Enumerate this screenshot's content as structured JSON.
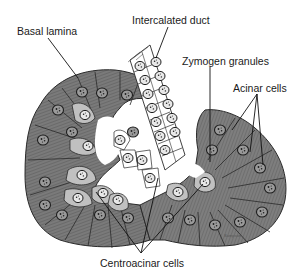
{
  "figure": {
    "labels": {
      "basal_lamina": "Basal lamina",
      "intercalated_duct": "Intercalated duct",
      "zymogen_granules": "Zymogen granules",
      "acinar_cells": "Acinar cells",
      "centroacinar_cells": "Centroacinar cells"
    },
    "signature": "Sampson",
    "colors": {
      "acinar_cell": "#7d7d7d",
      "acinar_dark": "#5e5e5e",
      "centroacinar_cell": "#bdbdbd",
      "duct_cell": "#ffffff",
      "outline": "#2a2a2a",
      "leader_line": "#111111"
    }
  }
}
